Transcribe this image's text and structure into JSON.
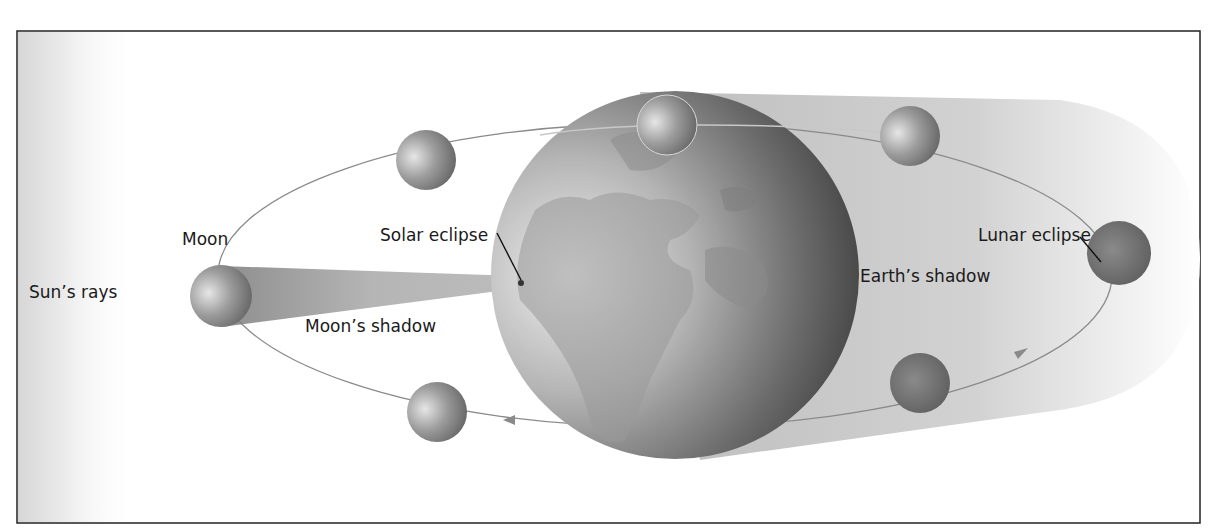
{
  "diagram": {
    "type": "eclipse-diagram",
    "labels": {
      "sun_rays": "Sun’s rays",
      "moon": "Moon",
      "solar_eclipse": "Solar eclipse",
      "moons_shadow": "Moon’s shadow",
      "earths_shadow": "Earth’s shadow",
      "lunar_eclipse": "Lunar eclipse"
    },
    "colors": {
      "frame": "#222222",
      "orbit": "#8a8a8a",
      "earth_light": "#d9d9d9",
      "earth_dark": "#3a3a3a",
      "shadow": "#cfcfcf",
      "moon": "#8c8c8c"
    },
    "earth": {
      "cx": 675,
      "cy": 275,
      "r": 184
    },
    "orbit": {
      "cx": 665,
      "cy": 275,
      "rx": 447,
      "ry": 152
    },
    "moons": [
      {
        "id": "moon-left",
        "cx": 221,
        "cy": 296,
        "r": 31
      },
      {
        "id": "moon-upper-left",
        "cx": 426,
        "cy": 160,
        "r": 30
      },
      {
        "id": "moon-top",
        "cx": 667,
        "cy": 125,
        "r": 30
      },
      {
        "id": "moon-upper-right",
        "cx": 910,
        "cy": 136,
        "r": 30
      },
      {
        "id": "moon-lunar-eclipse",
        "cx": 1119,
        "cy": 253,
        "r": 32
      },
      {
        "id": "moon-lower-right",
        "cx": 920,
        "cy": 383,
        "r": 30
      },
      {
        "id": "moon-lower-left",
        "cx": 437,
        "cy": 412,
        "r": 30
      }
    ]
  }
}
